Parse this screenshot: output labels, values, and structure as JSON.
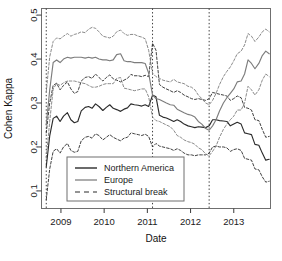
{
  "chart_data": {
    "type": "line",
    "title": "",
    "xlabel": "Date",
    "ylabel": "Cohen Kappa",
    "xlim": [
      2008.55,
      2013.85
    ],
    "ylim": [
      0.06,
      0.515
    ],
    "grid": false,
    "legend_position": "bottom-center-inside",
    "xticks": [
      2009,
      2010,
      2011,
      2012,
      2013
    ],
    "xtick_labels": [
      "2009",
      "2010",
      "2011",
      "2012",
      "2013"
    ],
    "yticks": [
      0.1,
      0.2,
      0.3,
      0.4,
      0.5
    ],
    "ytick_labels": [
      "0.1",
      "0.2",
      "0.3",
      "0.4",
      "0.5"
    ],
    "annotations": {
      "structural_breaks": [
        2008.66,
        2011.12,
        2012.43
      ]
    },
    "series": [
      {
        "name": "Northern America",
        "style": "solid",
        "color": "#2b2b2b",
        "role": "estimate",
        "x": [
          2008.66,
          2008.74,
          2008.82,
          2008.9,
          2008.98,
          2009.06,
          2009.15,
          2009.23,
          2009.31,
          2009.39,
          2009.47,
          2009.56,
          2009.64,
          2009.72,
          2009.8,
          2009.88,
          2009.97,
          2010.05,
          2010.13,
          2010.21,
          2010.29,
          2010.38,
          2010.46,
          2010.54,
          2010.62,
          2010.7,
          2010.79,
          2010.87,
          2010.95,
          2011.03,
          2011.12,
          2011.2,
          2011.28,
          2011.36,
          2011.44,
          2011.53,
          2011.61,
          2011.69,
          2011.77,
          2011.85,
          2011.94,
          2012.02,
          2012.1,
          2012.18,
          2012.26,
          2012.35,
          2012.43,
          2012.51,
          2012.59,
          2012.67,
          2012.76,
          2012.84,
          2012.92,
          2013.0,
          2013.08,
          2013.17,
          2013.25,
          2013.33,
          2013.41,
          2013.49,
          2013.58,
          2013.66,
          2013.74,
          2013.82
        ],
        "y": [
          0.155,
          0.225,
          0.265,
          0.27,
          0.258,
          0.27,
          0.278,
          0.262,
          0.255,
          0.258,
          0.282,
          0.29,
          0.292,
          0.288,
          0.298,
          0.292,
          0.283,
          0.29,
          0.296,
          0.288,
          0.285,
          0.281,
          0.286,
          0.289,
          0.298,
          0.296,
          0.295,
          0.293,
          0.296,
          0.292,
          0.318,
          0.314,
          0.272,
          0.268,
          0.266,
          0.262,
          0.258,
          0.262,
          0.258,
          0.252,
          0.248,
          0.246,
          0.244,
          0.246,
          0.245,
          0.244,
          0.248,
          0.262,
          0.262,
          0.26,
          0.259,
          0.258,
          0.248,
          0.252,
          0.256,
          0.252,
          0.232,
          0.23,
          0.228,
          0.206,
          0.204,
          0.186,
          0.17,
          0.172
        ]
      },
      {
        "name": "Northern America upper CI",
        "style": "dashed",
        "color": "#2b2b2b",
        "role": "confidence-upper",
        "x": [
          2008.66,
          2008.74,
          2008.82,
          2008.9,
          2008.98,
          2009.06,
          2009.15,
          2009.23,
          2009.31,
          2009.39,
          2009.47,
          2009.56,
          2009.64,
          2009.72,
          2009.8,
          2009.88,
          2009.97,
          2010.05,
          2010.13,
          2010.21,
          2010.29,
          2010.38,
          2010.46,
          2010.54,
          2010.62,
          2010.7,
          2010.79,
          2010.87,
          2010.95,
          2011.03,
          2011.12,
          2011.2,
          2011.28,
          2011.36,
          2011.44,
          2011.53,
          2011.61,
          2011.69,
          2011.77,
          2011.85,
          2011.94,
          2012.02,
          2012.1,
          2012.18,
          2012.26,
          2012.35,
          2012.43,
          2012.51,
          2012.59,
          2012.67,
          2012.76,
          2012.84,
          2012.92,
          2013.0,
          2013.08,
          2013.17,
          2013.25,
          2013.33,
          2013.41,
          2013.49,
          2013.58,
          2013.66,
          2013.74,
          2013.82
        ],
        "y": [
          0.232,
          0.3,
          0.34,
          0.345,
          0.33,
          0.34,
          0.348,
          0.332,
          0.322,
          0.326,
          0.35,
          0.358,
          0.36,
          0.356,
          0.366,
          0.358,
          0.35,
          0.358,
          0.364,
          0.355,
          0.352,
          0.348,
          0.352,
          0.356,
          0.365,
          0.362,
          0.362,
          0.36,
          0.363,
          0.36,
          0.436,
          0.42,
          0.342,
          0.336,
          0.332,
          0.328,
          0.324,
          0.328,
          0.324,
          0.318,
          0.314,
          0.31,
          0.308,
          0.31,
          0.308,
          0.306,
          0.31,
          0.324,
          0.322,
          0.32,
          0.318,
          0.316,
          0.306,
          0.31,
          0.316,
          0.312,
          0.29,
          0.288,
          0.284,
          0.262,
          0.26,
          0.24,
          0.222,
          0.224
        ]
      },
      {
        "name": "Northern America lower CI",
        "style": "dashed",
        "color": "#2b2b2b",
        "role": "confidence-lower",
        "x": [
          2008.66,
          2008.74,
          2008.82,
          2008.9,
          2008.98,
          2009.06,
          2009.15,
          2009.23,
          2009.31,
          2009.39,
          2009.47,
          2009.56,
          2009.64,
          2009.72,
          2009.8,
          2009.88,
          2009.97,
          2010.05,
          2010.13,
          2010.21,
          2010.29,
          2010.38,
          2010.46,
          2010.54,
          2010.62,
          2010.7,
          2010.79,
          2010.87,
          2010.95,
          2011.03,
          2011.12,
          2011.2,
          2011.28,
          2011.36,
          2011.44,
          2011.53,
          2011.61,
          2011.69,
          2011.77,
          2011.85,
          2011.94,
          2012.02,
          2012.1,
          2012.18,
          2012.26,
          2012.35,
          2012.43,
          2012.51,
          2012.59,
          2012.67,
          2012.76,
          2012.84,
          2012.92,
          2013.0,
          2013.08,
          2013.17,
          2013.25,
          2013.33,
          2013.41,
          2013.49,
          2013.58,
          2013.66,
          2013.74,
          2013.82
        ],
        "y": [
          0.08,
          0.15,
          0.19,
          0.196,
          0.186,
          0.2,
          0.208,
          0.192,
          0.188,
          0.19,
          0.214,
          0.222,
          0.224,
          0.22,
          0.23,
          0.226,
          0.216,
          0.222,
          0.228,
          0.222,
          0.218,
          0.214,
          0.22,
          0.222,
          0.232,
          0.23,
          0.228,
          0.226,
          0.229,
          0.224,
          0.2,
          0.208,
          0.202,
          0.2,
          0.198,
          0.196,
          0.192,
          0.196,
          0.192,
          0.186,
          0.182,
          0.182,
          0.18,
          0.182,
          0.182,
          0.182,
          0.186,
          0.2,
          0.202,
          0.2,
          0.2,
          0.198,
          0.19,
          0.194,
          0.196,
          0.192,
          0.174,
          0.172,
          0.17,
          0.15,
          0.148,
          0.132,
          0.12,
          0.122
        ]
      },
      {
        "name": "Europe",
        "style": "solid",
        "color": "#7d7d7d",
        "role": "estimate",
        "x": [
          2008.66,
          2008.74,
          2008.82,
          2008.9,
          2008.98,
          2009.06,
          2009.15,
          2009.23,
          2009.31,
          2009.39,
          2009.47,
          2009.56,
          2009.64,
          2009.72,
          2009.8,
          2009.88,
          2009.97,
          2010.05,
          2010.13,
          2010.21,
          2010.29,
          2010.38,
          2010.46,
          2010.54,
          2010.62,
          2010.7,
          2010.79,
          2010.87,
          2010.95,
          2011.03,
          2011.12,
          2011.2,
          2011.28,
          2011.36,
          2011.44,
          2011.53,
          2011.61,
          2011.69,
          2011.77,
          2011.85,
          2011.94,
          2012.02,
          2012.1,
          2012.18,
          2012.26,
          2012.35,
          2012.43,
          2012.51,
          2012.59,
          2012.67,
          2012.76,
          2012.84,
          2012.92,
          2013.0,
          2013.08,
          2013.17,
          2013.25,
          2013.33,
          2013.41,
          2013.49,
          2013.58,
          2013.66,
          2013.74,
          2013.82
        ],
        "y": [
          0.25,
          0.33,
          0.392,
          0.398,
          0.392,
          0.4,
          0.404,
          0.402,
          0.404,
          0.404,
          0.404,
          0.402,
          0.404,
          0.402,
          0.404,
          0.4,
          0.398,
          0.398,
          0.396,
          0.398,
          0.41,
          0.412,
          0.396,
          0.394,
          0.394,
          0.392,
          0.392,
          0.392,
          0.39,
          0.368,
          0.318,
          0.31,
          0.308,
          0.304,
          0.3,
          0.296,
          0.295,
          0.286,
          0.282,
          0.278,
          0.274,
          0.272,
          0.268,
          0.258,
          0.252,
          0.242,
          0.238,
          0.248,
          0.262,
          0.282,
          0.3,
          0.312,
          0.322,
          0.332,
          0.348,
          0.35,
          0.366,
          0.398,
          0.39,
          0.378,
          0.39,
          0.408,
          0.418,
          0.412
        ]
      },
      {
        "name": "Europe upper CI",
        "style": "dashed",
        "color": "#7d7d7d",
        "role": "confidence-upper",
        "x": [
          2008.66,
          2008.74,
          2008.82,
          2008.9,
          2008.98,
          2009.06,
          2009.15,
          2009.23,
          2009.31,
          2009.39,
          2009.47,
          2009.56,
          2009.64,
          2009.72,
          2009.8,
          2009.88,
          2009.97,
          2010.05,
          2010.13,
          2010.21,
          2010.29,
          2010.38,
          2010.46,
          2010.54,
          2010.62,
          2010.7,
          2010.79,
          2010.87,
          2010.95,
          2011.03,
          2011.12,
          2011.2,
          2011.28,
          2011.36,
          2011.44,
          2011.53,
          2011.61,
          2011.69,
          2011.77,
          2011.85,
          2011.94,
          2012.02,
          2012.1,
          2012.18,
          2012.26,
          2012.35,
          2012.43,
          2012.51,
          2012.59,
          2012.67,
          2012.76,
          2012.84,
          2012.92,
          2013.0,
          2013.08,
          2013.17,
          2013.25,
          2013.33,
          2013.41,
          2013.49,
          2013.58,
          2013.66,
          2013.74,
          2013.82
        ],
        "y": [
          0.325,
          0.405,
          0.44,
          0.448,
          0.446,
          0.452,
          0.458,
          0.452,
          0.456,
          0.458,
          0.462,
          0.46,
          0.468,
          0.472,
          0.47,
          0.462,
          0.452,
          0.45,
          0.448,
          0.452,
          0.462,
          0.466,
          0.458,
          0.454,
          0.456,
          0.456,
          0.452,
          0.45,
          0.446,
          0.42,
          0.368,
          0.36,
          0.356,
          0.352,
          0.35,
          0.348,
          0.354,
          0.348,
          0.346,
          0.344,
          0.338,
          0.336,
          0.33,
          0.318,
          0.31,
          0.3,
          0.296,
          0.306,
          0.322,
          0.342,
          0.36,
          0.372,
          0.382,
          0.396,
          0.412,
          0.418,
          0.432,
          0.458,
          0.452,
          0.44,
          0.45,
          0.462,
          0.468,
          0.462
        ]
      },
      {
        "name": "Europe lower CI",
        "style": "dashed",
        "color": "#7d7d7d",
        "role": "confidence-lower",
        "x": [
          2008.66,
          2008.74,
          2008.82,
          2008.9,
          2008.98,
          2009.06,
          2009.15,
          2009.23,
          2009.31,
          2009.39,
          2009.47,
          2009.56,
          2009.64,
          2009.72,
          2009.8,
          2009.88,
          2009.97,
          2010.05,
          2010.13,
          2010.21,
          2010.29,
          2010.38,
          2010.46,
          2010.54,
          2010.62,
          2010.7,
          2010.79,
          2010.87,
          2010.95,
          2011.03,
          2011.12,
          2011.2,
          2011.28,
          2011.36,
          2011.44,
          2011.53,
          2011.61,
          2011.69,
          2011.77,
          2011.85,
          2011.94,
          2012.02,
          2012.1,
          2012.18,
          2012.26,
          2012.35,
          2012.43,
          2012.51,
          2012.59,
          2012.67,
          2012.76,
          2012.84,
          2012.92,
          2013.0,
          2013.08,
          2013.17,
          2013.25,
          2013.33,
          2013.41,
          2013.49,
          2013.58,
          2013.66,
          2013.74,
          2013.82
        ],
        "y": [
          0.175,
          0.258,
          0.332,
          0.344,
          0.34,
          0.346,
          0.35,
          0.35,
          0.35,
          0.348,
          0.346,
          0.344,
          0.34,
          0.336,
          0.336,
          0.338,
          0.342,
          0.344,
          0.344,
          0.344,
          0.356,
          0.358,
          0.334,
          0.332,
          0.33,
          0.328,
          0.33,
          0.332,
          0.332,
          0.314,
          0.268,
          0.26,
          0.258,
          0.254,
          0.25,
          0.246,
          0.238,
          0.226,
          0.222,
          0.216,
          0.212,
          0.21,
          0.206,
          0.198,
          0.194,
          0.184,
          0.18,
          0.19,
          0.202,
          0.222,
          0.24,
          0.252,
          0.262,
          0.27,
          0.284,
          0.284,
          0.3,
          0.338,
          0.33,
          0.318,
          0.33,
          0.352,
          0.366,
          0.36
        ]
      }
    ],
    "legend": [
      {
        "label": "Northern America",
        "style": "solid",
        "color": "#2b2b2b"
      },
      {
        "label": "Europe",
        "style": "solid",
        "color": "#8a8a8a"
      },
      {
        "label": "Structural break",
        "style": "dashed",
        "color": "#2b2b2b"
      }
    ]
  }
}
